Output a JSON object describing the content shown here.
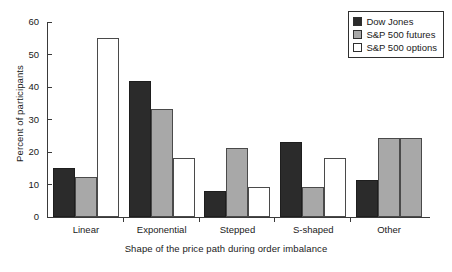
{
  "chart_data": {
    "type": "bar",
    "title": "",
    "xlabel": "Shape of the price path during order imbalance",
    "ylabel": "Percent of participants",
    "categories": [
      "Linear",
      "Exponential",
      "Stepped",
      "S-shaped",
      "Other"
    ],
    "series": [
      {
        "name": "Dow Jones",
        "color": "#2b2b2b",
        "values": [
          15.2,
          42.0,
          8.0,
          23.0,
          11.5
        ]
      },
      {
        "name": "S&P 500 futures",
        "color": "#a8a8a8",
        "values": [
          12.2,
          33.3,
          21.2,
          9.2,
          24.2
        ]
      },
      {
        "name": "S&P 500 options",
        "color": "#ffffff",
        "values": [
          55.0,
          18.2,
          9.2,
          18.2,
          24.2
        ]
      }
    ],
    "ylim": [
      0,
      60
    ],
    "yticks": [
      0,
      10,
      20,
      30,
      40,
      50,
      60
    ],
    "ytick_labels": [
      "0",
      "10",
      "20",
      "30",
      "40",
      "50",
      "60"
    ],
    "grid": false,
    "legend_position": "top-right"
  },
  "legend": {
    "items": [
      {
        "label": "Dow Jones"
      },
      {
        "label": "S&P 500 futures"
      },
      {
        "label": "S&P 500 options"
      }
    ]
  }
}
